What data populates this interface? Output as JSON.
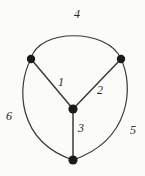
{
  "figure": {
    "width": 145,
    "height": 176,
    "background_color": "#fbfbf9",
    "stroke_color": "#3a3a3a",
    "vertex_color": "#1a1a1a",
    "label_color": "#2b2b2b"
  },
  "vertices": [
    {
      "id": "v-top-left",
      "x": 31,
      "y": 59,
      "r": 4.2
    },
    {
      "id": "v-top-right",
      "x": 121,
      "y": 59,
      "r": 4.2
    },
    {
      "id": "v-center",
      "x": 73,
      "y": 109,
      "r": 4.6
    },
    {
      "id": "v-bottom",
      "x": 73,
      "y": 160,
      "r": 4.6
    }
  ],
  "edges": [
    {
      "id": "edge-1",
      "label": "1",
      "shape": "straight",
      "from": "v-top-left",
      "to": "v-center",
      "path": "M31,59 L73,109",
      "label_x": 61,
      "label_y": 82
    },
    {
      "id": "edge-2",
      "label": "2",
      "shape": "straight",
      "from": "v-top-right",
      "to": "v-center",
      "path": "M121,59 L73,109",
      "label_x": 100,
      "label_y": 90
    },
    {
      "id": "edge-3",
      "label": "3",
      "shape": "straight",
      "from": "v-center",
      "to": "v-bottom",
      "path": "M73,109 L73,160",
      "label_x": 81,
      "label_y": 128
    },
    {
      "id": "edge-4",
      "label": "4",
      "shape": "arc",
      "from": "v-top-left",
      "to": "v-top-right",
      "path": "M31,59 C38,28 108,28 121,59",
      "label_x": 77,
      "label_y": 14
    },
    {
      "id": "edge-5",
      "label": "5",
      "shape": "arc",
      "from": "v-top-right",
      "to": "v-bottom",
      "path": "M121,59 C134,86 131,140 73,160",
      "label_x": 133,
      "label_y": 130
    },
    {
      "id": "edge-6",
      "label": "6",
      "shape": "arc",
      "from": "v-top-left",
      "to": "v-bottom",
      "path": "M31,59 C16,86 17,141 73,160",
      "label_x": 9,
      "label_y": 116
    }
  ]
}
